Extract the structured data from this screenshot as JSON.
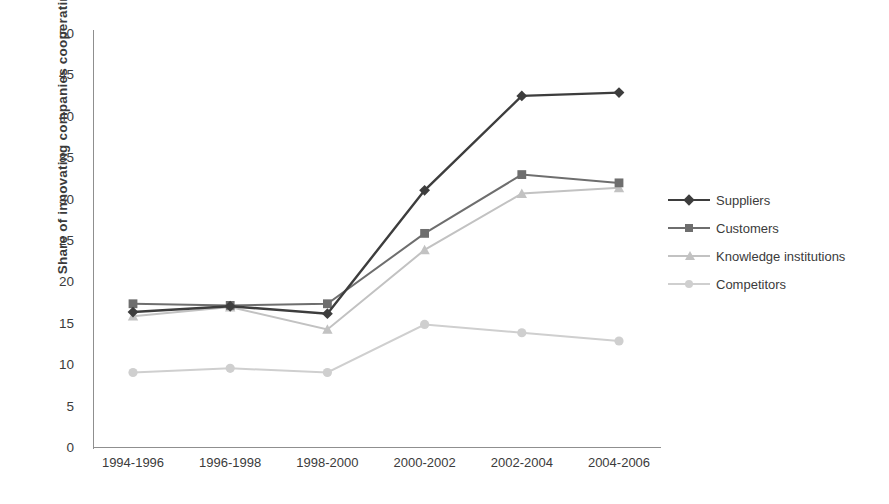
{
  "chart_data": {
    "type": "line",
    "title": "",
    "xlabel": "",
    "ylabel": "Share of innovating companies cooperating",
    "categories": [
      "1994-1996",
      "1996-1998",
      "1998-2000",
      "2000-2002",
      "2002-2004",
      "2004-2006"
    ],
    "ylim": [
      0,
      50
    ],
    "yticks": [
      0,
      5,
      10,
      15,
      20,
      25,
      30,
      35,
      40,
      45,
      50
    ],
    "grid": false,
    "legend_position": "right",
    "series": [
      {
        "name": "Suppliers",
        "marker": "diamond",
        "color": "#3d3d3d",
        "values": [
          16.3,
          17.0,
          16.1,
          31.0,
          42.4,
          42.8
        ]
      },
      {
        "name": "Customers",
        "marker": "square",
        "color": "#6e6e6e",
        "values": [
          17.3,
          17.1,
          17.3,
          25.8,
          32.9,
          31.9
        ]
      },
      {
        "name": "Knowledge institutions",
        "marker": "triangle",
        "color": "#c2c2c2",
        "values": [
          15.8,
          16.9,
          14.2,
          23.8,
          30.6,
          31.3
        ]
      },
      {
        "name": "Competitors",
        "marker": "circle",
        "color": "#cfcfcf",
        "values": [
          9.0,
          9.5,
          9.0,
          14.8,
          13.8,
          12.8
        ]
      }
    ]
  },
  "axis": {
    "y_tick_labels": [
      "50",
      "45",
      "40",
      "35",
      "30",
      "25",
      "20",
      "15",
      "10",
      "5",
      "0"
    ],
    "y_axis_title": "Share of innovating companies cooperating",
    "x_tick_labels": [
      "1994-1996",
      "1996-1998",
      "1998-2000",
      "2000-2002",
      "2002-2004",
      "2004-2006"
    ]
  },
  "legend": {
    "items": [
      {
        "label": "Suppliers",
        "color": "#3d3d3d",
        "marker": "diamond"
      },
      {
        "label": "Customers",
        "color": "#6e6e6e",
        "marker": "square"
      },
      {
        "label": "Knowledge institutions",
        "color": "#c2c2c2",
        "marker": "triangle"
      },
      {
        "label": "Competitors",
        "color": "#cfcfcf",
        "marker": "circle"
      }
    ]
  }
}
